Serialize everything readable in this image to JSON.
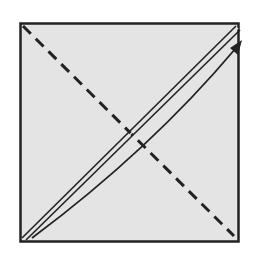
{
  "diagram": {
    "type": "origami-fold-step",
    "paper": {
      "shape": "square",
      "fill": "#e4e4e4",
      "stroke": "#222222"
    },
    "lines": [
      {
        "name": "valley-fold-line",
        "style": "dashed",
        "from": "top-left",
        "to": "bottom-right"
      },
      {
        "name": "folded-edge-double-line",
        "style": "double",
        "from": "bottom-left",
        "to": "top-right"
      }
    ],
    "arrows": [
      {
        "name": "fold-arrow",
        "from": "bottom-left",
        "to": "top-right",
        "curve": "slight"
      }
    ],
    "colors": {
      "background": "#ffffff",
      "paper": "#e4e4e4",
      "ink": "#222222"
    }
  }
}
